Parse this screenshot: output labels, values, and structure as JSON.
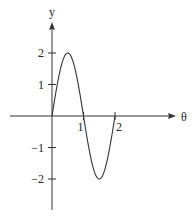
{
  "chart_data": {
    "type": "line",
    "title": "",
    "xlabel": "θ",
    "ylabel": "y",
    "function": "y = 2 sin(πθ)",
    "xlim": [
      0,
      2
    ],
    "ylim": [
      -2,
      2
    ],
    "x_ticks": [
      {
        "value": 1,
        "label": "1"
      },
      {
        "value": 2,
        "label": "2"
      }
    ],
    "y_ticks": [
      {
        "value": 2,
        "label": "2"
      },
      {
        "value": 1,
        "label": "1"
      },
      {
        "value": -1,
        "label": "−1"
      },
      {
        "value": -2,
        "label": "−2"
      }
    ],
    "series": [
      {
        "name": "y",
        "x": [
          0,
          0.25,
          0.5,
          0.75,
          1,
          1.25,
          1.5,
          1.75,
          2
        ],
        "y": [
          0,
          1.414,
          2,
          1.414,
          0,
          -1.414,
          -2,
          -1.414,
          0
        ]
      }
    ],
    "grid": false,
    "legend": "none"
  }
}
